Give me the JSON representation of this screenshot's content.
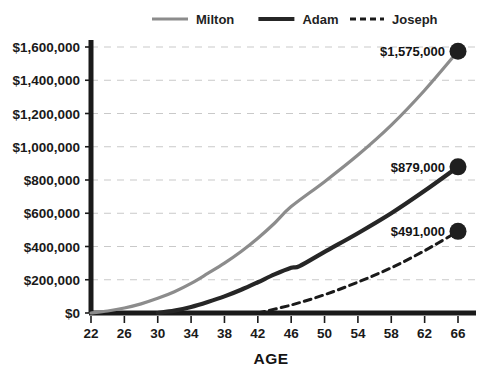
{
  "chart_data": {
    "type": "line",
    "title": "",
    "xlabel": "AGE",
    "ylabel": "",
    "xlim": [
      22,
      66
    ],
    "ylim": [
      0,
      1600000
    ],
    "grid": true,
    "legend_position": "top-center",
    "x_ticks": [
      22,
      26,
      30,
      34,
      38,
      42,
      46,
      50,
      54,
      58,
      62,
      66
    ],
    "y_ticks": [
      0,
      200000,
      400000,
      600000,
      800000,
      1000000,
      1200000,
      1400000,
      1600000
    ],
    "y_tick_labels": [
      "$0",
      "$200,000",
      "$400,000",
      "$600,000",
      "$800,000",
      "$1,000,000",
      "$1,200,000",
      "$1,400,000",
      "$1,600,000"
    ],
    "series": [
      {
        "name": "Milton",
        "color": "#8c8c8c",
        "width": 3.2,
        "dash": "none",
        "end_label": "$1,575,000",
        "end_value": 1575000,
        "x": [
          22,
          24,
          26,
          28,
          30,
          32,
          34,
          36,
          38,
          40,
          42,
          44,
          46,
          50,
          54,
          58,
          62,
          66
        ],
        "values": [
          0,
          12000,
          30000,
          55000,
          88000,
          128000,
          178000,
          238000,
          300000,
          370000,
          450000,
          540000,
          640000,
          790000,
          950000,
          1130000,
          1340000,
          1575000
        ]
      },
      {
        "name": "Adam",
        "color": "#262626",
        "width": 4.2,
        "dash": "none",
        "end_label": "$879,000",
        "end_value": 879000,
        "x": [
          30,
          32,
          34,
          36,
          38,
          40,
          42,
          44,
          46,
          47,
          50,
          54,
          58,
          62,
          66
        ],
        "values": [
          0,
          14000,
          36000,
          66000,
          100000,
          140000,
          185000,
          232000,
          272000,
          282000,
          368000,
          480000,
          600000,
          735000,
          879000
        ]
      },
      {
        "name": "Joseph",
        "color": "#1a1a1a",
        "width": 3.0,
        "dash": "7 5",
        "end_label": "$491,000",
        "end_value": 491000,
        "x": [
          42,
          46,
          50,
          54,
          58,
          62,
          66
        ],
        "values": [
          0,
          48000,
          110000,
          186000,
          272000,
          375000,
          491000
        ]
      }
    ],
    "annotations": [
      {
        "label": "$1,575,000",
        "series": "Milton",
        "x": 66,
        "y": 1575000
      },
      {
        "label": "$879,000",
        "series": "Adam",
        "x": 66,
        "y": 879000
      },
      {
        "label": "$491,000",
        "series": "Joseph",
        "x": 66,
        "y": 491000
      }
    ],
    "colors": {
      "milton": "#8c8c8c",
      "adam": "#262626",
      "joseph": "#1a1a1a",
      "grid": "#c9c9c9",
      "axis": "#1a1a1a",
      "background": "#ffffff"
    }
  },
  "legend": {
    "items": [
      {
        "label": "Milton"
      },
      {
        "label": "Adam"
      },
      {
        "label": "Joseph"
      }
    ]
  }
}
